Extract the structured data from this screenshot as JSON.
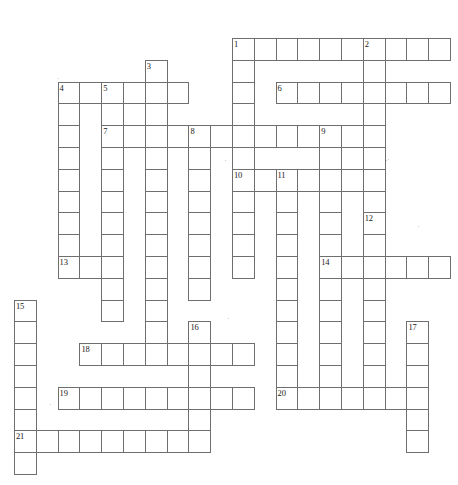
{
  "puzzle": {
    "title": "Crossword Puzzle Grid",
    "type": "crossword-grid",
    "width": 458,
    "height": 485,
    "cell_size": 21.8,
    "origin": {
      "x": 14,
      "y": 38
    },
    "background_color": "#ffffff",
    "cell_border_color": "#6f6f6f",
    "cell_fill_color": "#ffffff",
    "number_color": "#1a1a1a",
    "clue_count": 21,
    "numbers": [
      1,
      2,
      3,
      4,
      5,
      6,
      7,
      8,
      9,
      10,
      11,
      12,
      13,
      14,
      15,
      16,
      17,
      18,
      19,
      20,
      21
    ],
    "entries": [
      {
        "number": "1",
        "direction": "across",
        "row": 0,
        "col": 10,
        "length": 10
      },
      {
        "number": "1",
        "direction": "down",
        "row": 0,
        "col": 10,
        "length": 9
      },
      {
        "number": "2",
        "direction": "down",
        "row": 0,
        "col": 16,
        "length": 10
      },
      {
        "number": "3",
        "direction": "down",
        "row": 1,
        "col": 6,
        "length": 3
      },
      {
        "number": "4",
        "direction": "across",
        "row": 2,
        "col": 2,
        "length": 6
      },
      {
        "number": "4",
        "direction": "down",
        "row": 2,
        "col": 2,
        "length": 9
      },
      {
        "number": "5",
        "direction": "down",
        "row": 2,
        "col": 4,
        "length": 11
      },
      {
        "number": "6",
        "direction": "across",
        "row": 2,
        "col": 12,
        "length": 8
      },
      {
        "number": "7",
        "direction": "across",
        "row": 4,
        "col": 4,
        "length": 12
      },
      {
        "number": "7",
        "direction": "down",
        "row": 4,
        "col": 4,
        "length": 9
      },
      {
        "number": "8",
        "direction": "down",
        "row": 4,
        "col": 8,
        "length": 8
      },
      {
        "number": "9",
        "direction": "down",
        "row": 4,
        "col": 14,
        "length": 10
      },
      {
        "number": "10",
        "direction": "across",
        "row": 6,
        "col": 10,
        "length": 7
      },
      {
        "number": "10",
        "direction": "down",
        "row": 6,
        "col": 10,
        "length": 7
      },
      {
        "number": "11",
        "direction": "down",
        "row": 6,
        "col": 12,
        "length": 11
      },
      {
        "number": "12",
        "direction": "down",
        "row": 8,
        "col": 16,
        "length": 10
      },
      {
        "number": "13",
        "direction": "across",
        "row": 10,
        "col": 2,
        "length": 3
      },
      {
        "number": "14",
        "direction": "across",
        "row": 10,
        "col": 14,
        "length": 6
      },
      {
        "number": "15",
        "direction": "down",
        "row": 12,
        "col": 0,
        "length": 8
      },
      {
        "number": "16",
        "direction": "down",
        "row": 13,
        "col": 8,
        "length": 7
      },
      {
        "number": "17",
        "direction": "down",
        "row": 13,
        "col": 18,
        "length": 6
      },
      {
        "number": "18",
        "direction": "across",
        "row": 14,
        "col": 3,
        "length": 8
      },
      {
        "number": "19",
        "direction": "across",
        "row": 16,
        "col": 2,
        "length": 9
      },
      {
        "number": "20",
        "direction": "across",
        "row": 16,
        "col": 12,
        "length": 7
      },
      {
        "number": "21",
        "direction": "across",
        "row": 18,
        "col": 0,
        "length": 9
      }
    ],
    "cells": [
      {
        "r": 0,
        "c": 10,
        "n": "1"
      },
      {
        "r": 0,
        "c": 11
      },
      {
        "r": 0,
        "c": 12
      },
      {
        "r": 0,
        "c": 13
      },
      {
        "r": 0,
        "c": 14
      },
      {
        "r": 0,
        "c": 15
      },
      {
        "r": 0,
        "c": 16,
        "n": "2"
      },
      {
        "r": 0,
        "c": 17
      },
      {
        "r": 0,
        "c": 18
      },
      {
        "r": 0,
        "c": 19
      },
      {
        "r": 1,
        "c": 6,
        "n": "3"
      },
      {
        "r": 1,
        "c": 10
      },
      {
        "r": 1,
        "c": 16
      },
      {
        "r": 2,
        "c": 2,
        "n": "4"
      },
      {
        "r": 2,
        "c": 3
      },
      {
        "r": 2,
        "c": 4,
        "n": "5"
      },
      {
        "r": 2,
        "c": 5
      },
      {
        "r": 2,
        "c": 6
      },
      {
        "r": 2,
        "c": 7
      },
      {
        "r": 2,
        "c": 10
      },
      {
        "r": 2,
        "c": 12,
        "n": "6"
      },
      {
        "r": 2,
        "c": 13
      },
      {
        "r": 2,
        "c": 14
      },
      {
        "r": 2,
        "c": 15
      },
      {
        "r": 2,
        "c": 16
      },
      {
        "r": 2,
        "c": 17
      },
      {
        "r": 2,
        "c": 18
      },
      {
        "r": 2,
        "c": 19
      },
      {
        "r": 3,
        "c": 2
      },
      {
        "r": 3,
        "c": 4
      },
      {
        "r": 3,
        "c": 6
      },
      {
        "r": 3,
        "c": 10
      },
      {
        "r": 3,
        "c": 16
      },
      {
        "r": 4,
        "c": 2
      },
      {
        "r": 4,
        "c": 4,
        "n": "7"
      },
      {
        "r": 4,
        "c": 5
      },
      {
        "r": 4,
        "c": 6
      },
      {
        "r": 4,
        "c": 7
      },
      {
        "r": 4,
        "c": 8,
        "n": "8"
      },
      {
        "r": 4,
        "c": 9
      },
      {
        "r": 4,
        "c": 10
      },
      {
        "r": 4,
        "c": 11
      },
      {
        "r": 4,
        "c": 12
      },
      {
        "r": 4,
        "c": 13
      },
      {
        "r": 4,
        "c": 14,
        "n": "9"
      },
      {
        "r": 4,
        "c": 15
      },
      {
        "r": 4,
        "c": 16
      },
      {
        "r": 5,
        "c": 2
      },
      {
        "r": 5,
        "c": 4
      },
      {
        "r": 5,
        "c": 6
      },
      {
        "r": 5,
        "c": 8
      },
      {
        "r": 5,
        "c": 10
      },
      {
        "r": 5,
        "c": 14
      },
      {
        "r": 5,
        "c": 16
      },
      {
        "r": 6,
        "c": 2
      },
      {
        "r": 6,
        "c": 4
      },
      {
        "r": 6,
        "c": 6
      },
      {
        "r": 6,
        "c": 8
      },
      {
        "r": 6,
        "c": 10,
        "n": "10"
      },
      {
        "r": 6,
        "c": 11
      },
      {
        "r": 6,
        "c": 12,
        "n": "11"
      },
      {
        "r": 6,
        "c": 13
      },
      {
        "r": 6,
        "c": 14
      },
      {
        "r": 6,
        "c": 15
      },
      {
        "r": 6,
        "c": 16
      },
      {
        "r": 7,
        "c": 2
      },
      {
        "r": 7,
        "c": 4
      },
      {
        "r": 7,
        "c": 6
      },
      {
        "r": 7,
        "c": 8
      },
      {
        "r": 7,
        "c": 10
      },
      {
        "r": 7,
        "c": 12
      },
      {
        "r": 7,
        "c": 14
      },
      {
        "r": 7,
        "c": 16
      },
      {
        "r": 8,
        "c": 2
      },
      {
        "r": 8,
        "c": 4
      },
      {
        "r": 8,
        "c": 6
      },
      {
        "r": 8,
        "c": 8
      },
      {
        "r": 8,
        "c": 10
      },
      {
        "r": 8,
        "c": 12
      },
      {
        "r": 8,
        "c": 14
      },
      {
        "r": 8,
        "c": 16,
        "n": "12"
      },
      {
        "r": 9,
        "c": 2
      },
      {
        "r": 9,
        "c": 4
      },
      {
        "r": 9,
        "c": 6
      },
      {
        "r": 9,
        "c": 8
      },
      {
        "r": 9,
        "c": 10
      },
      {
        "r": 9,
        "c": 12
      },
      {
        "r": 9,
        "c": 14
      },
      {
        "r": 9,
        "c": 16
      },
      {
        "r": 10,
        "c": 2,
        "n": "13"
      },
      {
        "r": 10,
        "c": 3
      },
      {
        "r": 10,
        "c": 4
      },
      {
        "r": 10,
        "c": 6
      },
      {
        "r": 10,
        "c": 8
      },
      {
        "r": 10,
        "c": 10
      },
      {
        "r": 10,
        "c": 12
      },
      {
        "r": 10,
        "c": 14,
        "n": "14"
      },
      {
        "r": 10,
        "c": 15
      },
      {
        "r": 10,
        "c": 16
      },
      {
        "r": 10,
        "c": 17
      },
      {
        "r": 10,
        "c": 18
      },
      {
        "r": 10,
        "c": 19
      },
      {
        "r": 11,
        "c": 4
      },
      {
        "r": 11,
        "c": 6
      },
      {
        "r": 11,
        "c": 8
      },
      {
        "r": 11,
        "c": 12
      },
      {
        "r": 11,
        "c": 14
      },
      {
        "r": 11,
        "c": 16
      },
      {
        "r": 12,
        "c": 0,
        "n": "15"
      },
      {
        "r": 12,
        "c": 4
      },
      {
        "r": 12,
        "c": 6
      },
      {
        "r": 12,
        "c": 12
      },
      {
        "r": 12,
        "c": 14
      },
      {
        "r": 12,
        "c": 16
      },
      {
        "r": 13,
        "c": 0
      },
      {
        "r": 13,
        "c": 6
      },
      {
        "r": 13,
        "c": 8,
        "n": "16"
      },
      {
        "r": 13,
        "c": 12
      },
      {
        "r": 13,
        "c": 14
      },
      {
        "r": 13,
        "c": 16
      },
      {
        "r": 13,
        "c": 18,
        "n": "17"
      },
      {
        "r": 14,
        "c": 0
      },
      {
        "r": 14,
        "c": 3,
        "n": "18"
      },
      {
        "r": 14,
        "c": 4
      },
      {
        "r": 14,
        "c": 5
      },
      {
        "r": 14,
        "c": 6
      },
      {
        "r": 14,
        "c": 7
      },
      {
        "r": 14,
        "c": 8
      },
      {
        "r": 14,
        "c": 9
      },
      {
        "r": 14,
        "c": 10
      },
      {
        "r": 14,
        "c": 12
      },
      {
        "r": 14,
        "c": 14
      },
      {
        "r": 14,
        "c": 16
      },
      {
        "r": 14,
        "c": 18
      },
      {
        "r": 15,
        "c": 0
      },
      {
        "r": 15,
        "c": 8
      },
      {
        "r": 15,
        "c": 12
      },
      {
        "r": 15,
        "c": 14
      },
      {
        "r": 15,
        "c": 16
      },
      {
        "r": 15,
        "c": 18
      },
      {
        "r": 16,
        "c": 0
      },
      {
        "r": 16,
        "c": 2,
        "n": "19"
      },
      {
        "r": 16,
        "c": 3
      },
      {
        "r": 16,
        "c": 4
      },
      {
        "r": 16,
        "c": 5
      },
      {
        "r": 16,
        "c": 6
      },
      {
        "r": 16,
        "c": 7
      },
      {
        "r": 16,
        "c": 8
      },
      {
        "r": 16,
        "c": 9
      },
      {
        "r": 16,
        "c": 10
      },
      {
        "r": 16,
        "c": 12,
        "n": "20"
      },
      {
        "r": 16,
        "c": 13
      },
      {
        "r": 16,
        "c": 14
      },
      {
        "r": 16,
        "c": 15
      },
      {
        "r": 16,
        "c": 16
      },
      {
        "r": 16,
        "c": 17
      },
      {
        "r": 16,
        "c": 18
      },
      {
        "r": 17,
        "c": 0
      },
      {
        "r": 17,
        "c": 8
      },
      {
        "r": 17,
        "c": 18
      },
      {
        "r": 18,
        "c": 0,
        "n": "21"
      },
      {
        "r": 18,
        "c": 1
      },
      {
        "r": 18,
        "c": 2
      },
      {
        "r": 18,
        "c": 3
      },
      {
        "r": 18,
        "c": 4
      },
      {
        "r": 18,
        "c": 5
      },
      {
        "r": 18,
        "c": 6
      },
      {
        "r": 18,
        "c": 7
      },
      {
        "r": 18,
        "c": 8
      },
      {
        "r": 18,
        "c": 18
      },
      {
        "r": 19,
        "c": 0
      }
    ]
  }
}
